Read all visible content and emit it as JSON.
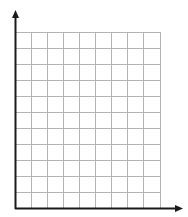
{
  "diagram": {
    "type": "blank-graph-grid",
    "columns": 9,
    "rows": 11,
    "cell_size_px": 16,
    "origin": {
      "x": 15,
      "y": 208
    },
    "x_axis_arrow_tip": 183,
    "y_axis_arrow_tip": 10,
    "colors": {
      "grid": "#b3b3b3",
      "axis": "#1a1a1a",
      "background": "#ffffff"
    },
    "labels": []
  }
}
